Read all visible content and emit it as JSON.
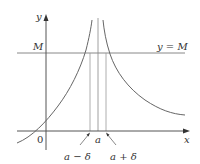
{
  "diagram": {
    "type": "vertical-asymptote-limit-illustration",
    "axes": {
      "x_label": "x",
      "y_label": "y",
      "origin_label": "0"
    },
    "horizontal_line": {
      "left_label": "M",
      "right_label": "y = M"
    },
    "vertical_lines": {
      "center_label": "a",
      "left_label": "a − δ",
      "right_label": "a + δ"
    },
    "colors": {
      "axis": "#555555",
      "curve": "#666666",
      "guide_line": "#888888",
      "text": "#333333",
      "background": "#ffffff"
    }
  }
}
